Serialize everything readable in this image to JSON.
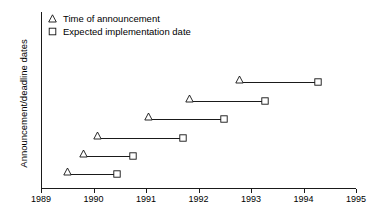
{
  "chart_data": {
    "type": "line",
    "title": "",
    "xlabel": "",
    "ylabel": "Announcement/deadline dates",
    "xlim": [
      1989,
      1995
    ],
    "xticks": [
      1989,
      1990,
      1991,
      1992,
      1993,
      1994,
      1995
    ],
    "xtick_labels": [
      "1989",
      "1990",
      "1991",
      "1992",
      "1993",
      "1994",
      "1995"
    ],
    "grid": false,
    "legend_position": "top-left",
    "legend": [
      {
        "label": "Time of announcement",
        "marker": "triangle-open"
      },
      {
        "label": "Expected implementation date",
        "marker": "square-open"
      }
    ],
    "series": [
      {
        "name": "Expected implementation date",
        "marker": "square-open",
        "values": [
          1990.45,
          1990.76,
          1991.7,
          1992.48,
          1993.26,
          1994.28
        ]
      },
      {
        "name": "Time of announcement",
        "marker": "triangle-open",
        "values": [
          1989.5,
          1989.8,
          1990.07,
          1991.05,
          1991.83,
          1992.79
        ]
      }
    ],
    "segments": [
      {
        "row": 1,
        "announcement": 1989.5,
        "implementation": 1990.45
      },
      {
        "row": 2,
        "announcement": 1989.8,
        "implementation": 1990.76
      },
      {
        "row": 3,
        "announcement": 1990.07,
        "implementation": 1991.7
      },
      {
        "row": 4,
        "announcement": 1991.05,
        "implementation": 1992.48
      },
      {
        "row": 5,
        "announcement": 1991.83,
        "implementation": 1993.26
      },
      {
        "row": 6,
        "announcement": 1992.79,
        "implementation": 1994.28
      }
    ]
  }
}
